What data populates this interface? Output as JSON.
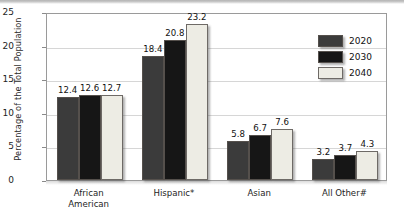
{
  "chart_data": {
    "type": "bar",
    "title": "",
    "xlabel": "",
    "ylabel": "Percentage of the Total Population",
    "ylim": [
      0,
      25
    ],
    "yticks": [
      "0",
      "5",
      "10",
      "15",
      "20",
      "25"
    ],
    "grid": true,
    "legend_position": "inside-top-right",
    "categories": [
      "African American",
      "Hispanic*",
      "Asian",
      "All Other#"
    ],
    "category_lines": [
      [
        "African",
        "American"
      ],
      [
        "Hispanic*"
      ],
      [
        "Asian"
      ],
      [
        "All Other#"
      ]
    ],
    "series": [
      {
        "name": "2020",
        "color": "#3b3b3b",
        "values": [
          12.4,
          18.4,
          5.8,
          3.2
        ]
      },
      {
        "name": "2030",
        "color": "#161616",
        "values": [
          12.6,
          20.8,
          6.7,
          3.7
        ]
      },
      {
        "name": "2040",
        "color": "#edece4",
        "values": [
          12.7,
          23.2,
          7.6,
          4.3
        ]
      }
    ],
    "value_labels": [
      [
        "12.4",
        "12.6",
        "12.7"
      ],
      [
        "18.4",
        "20.8",
        "23.2"
      ],
      [
        "5.8",
        "6.7",
        "7.6"
      ],
      [
        "3.2",
        "3.7",
        "4.3"
      ]
    ]
  },
  "legend": {
    "items": [
      {
        "label": "2020"
      },
      {
        "label": "2030"
      },
      {
        "label": "2040"
      }
    ]
  }
}
